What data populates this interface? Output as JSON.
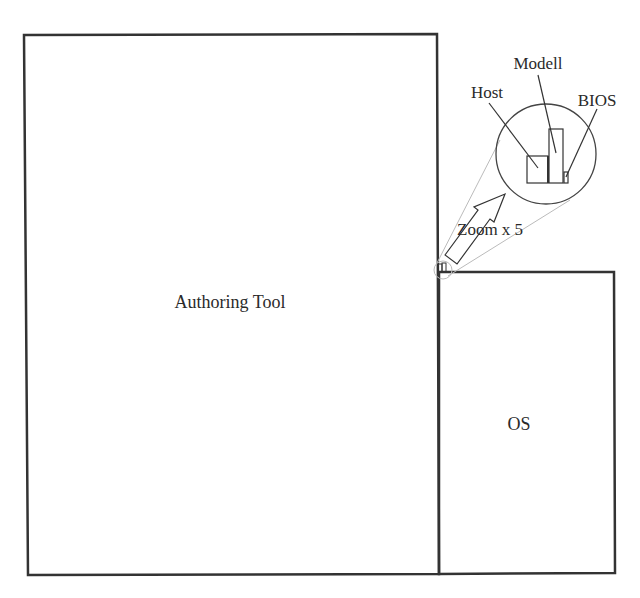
{
  "diagram": {
    "type": "treemap-like block diagram",
    "blocks": [
      {
        "id": "authoring-tool",
        "label": "Authoring Tool"
      },
      {
        "id": "os",
        "label": "OS"
      }
    ],
    "zoom_inset": {
      "label": "Zoom x 5",
      "items": [
        {
          "id": "host",
          "label": "Host"
        },
        {
          "id": "modell",
          "label": "Modell"
        },
        {
          "id": "bios",
          "label": "BIOS"
        }
      ]
    },
    "colors": {
      "stroke": "#333333",
      "guide": "#bbbbbb",
      "text": "#2a2a2a",
      "background": "#ffffff"
    }
  }
}
